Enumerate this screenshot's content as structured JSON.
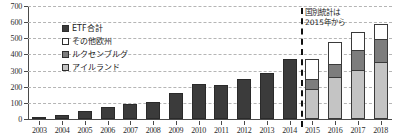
{
  "chart_data": {
    "type": "bar",
    "title": "",
    "subtitle": "",
    "xlabel": "",
    "ylabel": "",
    "ylim": [
      0,
      700
    ],
    "ytick_step": 100,
    "yticks": [
      "0",
      "100",
      "200",
      "300",
      "400",
      "500",
      "600",
      "700"
    ],
    "grid": true,
    "stacked": true,
    "legend_position": "inside-upper-left",
    "categories": [
      "2003",
      "2004",
      "2005",
      "2006",
      "2007",
      "2008",
      "2009",
      "2010",
      "2011",
      "2012",
      "2013",
      "2014",
      "2015",
      "2016",
      "2017",
      "2018"
    ],
    "series": [
      {
        "name": "ETF合計",
        "key": "etf-total",
        "color": "#3b3b3b",
        "values": [
          15,
          24,
          47,
          73,
          91,
          104,
          164,
          215,
          208,
          249,
          282,
          370,
          null,
          null,
          null,
          null
        ]
      },
      {
        "name": "アイルランド",
        "key": "ireland",
        "color": "#c4c4c4",
        "values": [
          null,
          null,
          null,
          null,
          null,
          null,
          null,
          null,
          null,
          null,
          null,
          null,
          180,
          255,
          300,
          345
        ]
      },
      {
        "name": "ルクセンブルグ",
        "key": "luxembourg",
        "color": "#7d7d7d",
        "values": [
          null,
          null,
          null,
          null,
          null,
          null,
          null,
          null,
          null,
          null,
          null,
          null,
          60,
          80,
          120,
          145
        ]
      },
      {
        "name": "その他欧州",
        "key": "other-europe",
        "color": "#ffffff",
        "values": [
          null,
          null,
          null,
          null,
          null,
          null,
          null,
          null,
          null,
          null,
          null,
          null,
          125,
          135,
          115,
          95
        ]
      }
    ],
    "annotations": [
      {
        "name": "country-breakdown-note",
        "line1": "国別統計は",
        "line2": "2015年から",
        "divider_after_category": "2014"
      }
    ],
    "legend": [
      {
        "label": "ETF合計",
        "color": "#3b3b3b",
        "key": "etf-total"
      },
      {
        "label": "その他欧州",
        "color": "#ffffff",
        "key": "other-europe"
      },
      {
        "label": "ルクセンブルグ",
        "color": "#7d7d7d",
        "key": "luxembourg"
      },
      {
        "label": "アイルランド",
        "color": "#c4c4c4",
        "key": "ireland"
      }
    ]
  }
}
